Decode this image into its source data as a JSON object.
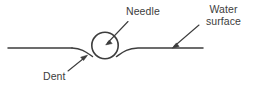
{
  "figure": {
    "name": "needle-floating-on-water-surface",
    "width": 253,
    "height": 95,
    "background_color": "#ffffff",
    "stroke_color": "#3d3d3d",
    "text_color": "#3d3d3d"
  },
  "labels": {
    "needle": "Needle",
    "water_surface_line1": "Water",
    "water_surface_line2": "surface",
    "dent": "Dent"
  },
  "elements": {
    "needle_circle": "needle-cross-section-circle",
    "water_surface_line": "water-surface-line",
    "dent_curve": "dent-depression-in-surface",
    "needle_leader": "needle-leader-arrow",
    "water_surface_leader": "water-surface-leader-arrow",
    "dent_leader": "dent-leader-arrow"
  }
}
